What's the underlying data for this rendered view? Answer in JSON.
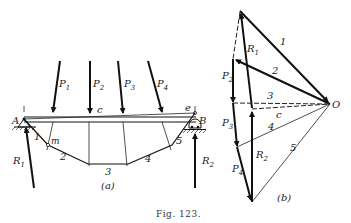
{
  "figure": {
    "caption": "Fig. 123.",
    "part_a": {
      "label": "(a)",
      "supports": {
        "left": "A",
        "right": "B"
      },
      "loads": [
        "P1",
        "P2",
        "P3",
        "P4"
      ],
      "reactions": [
        "R1",
        "R2"
      ],
      "closing_line_label": "c",
      "point_labels": {
        "m": "m",
        "e": "e"
      },
      "funicular_segments": [
        "1",
        "2",
        "3",
        "4",
        "5"
      ]
    },
    "part_b": {
      "label": "(b)",
      "pole": "O",
      "forces": [
        "P1",
        "P2",
        "P3",
        "P4",
        "R1",
        "R2"
      ],
      "rays": [
        "1",
        "2",
        "3",
        "4",
        "5"
      ],
      "closing_ray_label": "c"
    }
  },
  "labels": {
    "A": "A",
    "B": "B",
    "P1": "P",
    "P1s": "1",
    "P2": "P",
    "P2s": "2",
    "P3": "P",
    "P3s": "3",
    "P4": "P",
    "P4s": "4",
    "R1": "R",
    "R1s": "1",
    "R2": "R",
    "R2s": "2",
    "c": "c",
    "m": "m",
    "e": "e",
    "s1": "1",
    "s2": "2",
    "s3": "3",
    "s4": "4",
    "s5": "5",
    "O": "O",
    "a": "(a)",
    "b": "(b)",
    "caption": "Fig. 123."
  }
}
